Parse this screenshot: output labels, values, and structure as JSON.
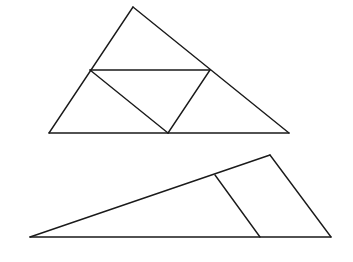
{
  "canvas": {
    "width": 353,
    "height": 262,
    "background": "#ffffff",
    "stroke": "#1a1a1a"
  },
  "figures": [
    {
      "name": "triangle-with-midsegments",
      "vertices": {
        "A": [
          133,
          7
        ],
        "B": [
          49,
          133
        ],
        "C": [
          289,
          133
        ]
      },
      "midpoints": {
        "M_AB": [
          90,
          70
        ],
        "M_AC": [
          210,
          70
        ],
        "M_BC": [
          168,
          133
        ]
      },
      "segments": [
        {
          "from": [
            133,
            7
          ],
          "to": [
            49,
            133
          ]
        },
        {
          "from": [
            49,
            133
          ],
          "to": [
            289,
            133
          ]
        },
        {
          "from": [
            289,
            133
          ],
          "to": [
            133,
            7
          ]
        },
        {
          "from": [
            90,
            70
          ],
          "to": [
            210,
            70
          ]
        },
        {
          "from": [
            90,
            70
          ],
          "to": [
            168,
            133
          ]
        },
        {
          "from": [
            210,
            70
          ],
          "to": [
            168,
            133
          ]
        }
      ]
    },
    {
      "name": "obtuse-triangle-with-parallel-segment",
      "vertices": {
        "P": [
          30,
          237
        ],
        "Q": [
          270,
          155
        ],
        "R": [
          331,
          237
        ]
      },
      "inner_points": {
        "S": [
          215,
          175
        ],
        "T": [
          260,
          237
        ]
      },
      "segments": [
        {
          "from": [
            30,
            237
          ],
          "to": [
            270,
            155
          ]
        },
        {
          "from": [
            270,
            155
          ],
          "to": [
            331,
            237
          ]
        },
        {
          "from": [
            331,
            237
          ],
          "to": [
            30,
            237
          ]
        },
        {
          "from": [
            215,
            175
          ],
          "to": [
            260,
            237
          ]
        }
      ]
    }
  ]
}
